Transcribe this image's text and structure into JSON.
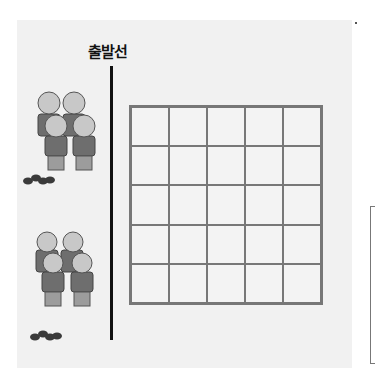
{
  "title": "출발선",
  "grid": {
    "rows": 5,
    "cols": 5
  },
  "groups": [
    {
      "name": "top-group",
      "people": 4
    },
    {
      "name": "bottom-group",
      "people": 4
    }
  ],
  "colors": {
    "head": "#c8c8c8",
    "shirt": "#6e6e6e",
    "pants": "#9c9c9c",
    "line": "#111111",
    "grid": "#777777",
    "stone": "#3a3a3a"
  }
}
